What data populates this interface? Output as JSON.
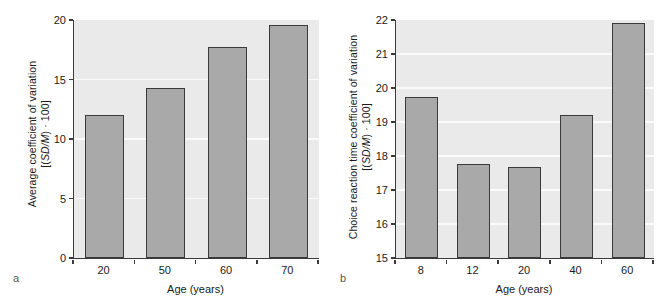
{
  "figure": {
    "background_color": "#ffffff",
    "plot_background_color": "#eaeaea",
    "bar_fill_color": "#a9a9a9",
    "bar_edge_color": "#3a3a3a",
    "gridline_color": "#fbfbfb"
  },
  "panels": [
    {
      "letter": "a",
      "ylabel_line1_pre": "Average coefficient of variation",
      "ylabel_line2_pre": "[(",
      "ylabel_line2_italic": "SD/M",
      "ylabel_line2_post": ") · 100]",
      "xlabel": "Age (years)"
    },
    {
      "letter": "b",
      "ylabel_line1_pre": "Choice reaction time coefficient of variation",
      "ylabel_line2_pre": "[(",
      "ylabel_line2_italic": "SD/M",
      "ylabel_line2_post": ") · 100]",
      "xlabel": "Age (years)"
    }
  ],
  "chart_data": [
    {
      "type": "bar",
      "panel": "a",
      "title": "",
      "xlabel": "Age (years)",
      "ylabel": "Average coefficient of variation [(SD/M) · 100]",
      "categories": [
        "20",
        "50",
        "60",
        "70"
      ],
      "values": [
        12.0,
        14.3,
        17.7,
        19.6
      ],
      "ylim": [
        0,
        20
      ],
      "yticks": [
        0,
        5,
        10,
        15,
        20
      ],
      "ytick_labels": [
        "0",
        "5",
        "10",
        "15",
        "20"
      ],
      "grid": true,
      "grid_axis": "y",
      "legend": false
    },
    {
      "type": "bar",
      "panel": "b",
      "title": "",
      "xlabel": "Age (years)",
      "ylabel": "Choice reaction time coefficient of variation [(SD/M) · 100]",
      "categories": [
        "8",
        "12",
        "20",
        "40",
        "60"
      ],
      "values": [
        19.75,
        17.77,
        17.67,
        19.22,
        21.9
      ],
      "ylim": [
        15,
        22
      ],
      "yticks": [
        15,
        16,
        17,
        18,
        19,
        20,
        21,
        22
      ],
      "ytick_labels": [
        "15",
        "16",
        "17",
        "18",
        "19",
        "20",
        "21",
        "22"
      ],
      "grid": true,
      "grid_axis": "y",
      "legend": false
    }
  ]
}
